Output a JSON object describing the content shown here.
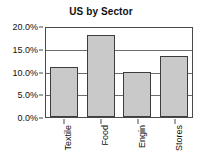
{
  "chart_data": {
    "type": "bar",
    "title": "US by Sector",
    "xlabel": "",
    "ylabel": "",
    "categories": [
      "Textile",
      "Food",
      "Engin",
      "Stores"
    ],
    "values": [
      11.3,
      18.4,
      10.1,
      13.8
    ],
    "ylim": [
      0,
      20
    ],
    "ytick_values": [
      0,
      5,
      10,
      15,
      20
    ],
    "ytick_labels": [
      "0.0%",
      "5.0%",
      "10.0%",
      "15.0%",
      "20.0%"
    ],
    "grid": "horizontal",
    "legend": "none",
    "bar_fill_color": "#c9c9c9",
    "bar_border_color": "#3d3d3d",
    "axis_color": "#4a4a4a",
    "background_color": "#ffffff",
    "xtick_label_rotation": "90"
  }
}
